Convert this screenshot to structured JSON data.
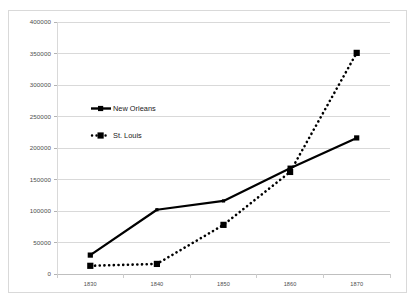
{
  "chart_data": {
    "type": "line",
    "title": "",
    "subtitle": "",
    "xlabel": "",
    "ylabel": "",
    "x": [
      1830,
      1840,
      1850,
      1860,
      1870
    ],
    "categories": [
      "1830",
      "1840",
      "1850",
      "1860",
      "1870"
    ],
    "series": [
      {
        "name": "New Orleans",
        "values": [
          30000,
          102000,
          116000,
          168000,
          216000
        ],
        "style": "solid",
        "color": "#000000",
        "marker": "square"
      },
      {
        "name": "St. Louis",
        "values": [
          13000,
          16000,
          78000,
          162000,
          351000
        ],
        "style": "dotted",
        "color": "#000000",
        "marker": "square"
      }
    ],
    "ylim": [
      0,
      400000
    ],
    "yticks": [
      0,
      50000,
      100000,
      150000,
      200000,
      250000,
      300000,
      350000,
      400000
    ],
    "ytick_labels": [
      "0",
      "50000",
      "100000",
      "150000",
      "200000",
      "250000",
      "300000",
      "350000",
      "400000"
    ],
    "xtick_labels": [
      "1830",
      "1840",
      "1850",
      "1860",
      "1870"
    ],
    "grid": true,
    "grid_axis": "y",
    "legend_position": "inside-upper-left",
    "gridline_color": "#d9d9d9",
    "border_color": "#d9d9d9",
    "background_color": "#ffffff"
  },
  "legend": {
    "entries": [
      {
        "label": "New Orleans"
      },
      {
        "label": "St. Louis"
      }
    ]
  }
}
